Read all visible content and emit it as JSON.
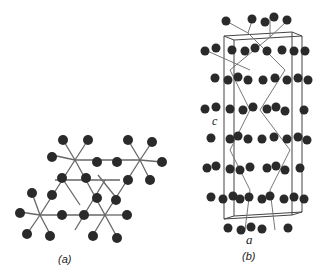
{
  "figure": {
    "panels": [
      {
        "id": "a",
        "label": "(a)",
        "description": "layered triangular network of octahedral units, top view"
      },
      {
        "id": "b",
        "label": "(b)",
        "description": "unit cell perspective view of crystal structure",
        "axis_c": "c",
        "axis_a": "a"
      }
    ],
    "colors": {
      "atom": "#2a2a2a",
      "bond": "#555555",
      "cell": "#333333"
    }
  }
}
